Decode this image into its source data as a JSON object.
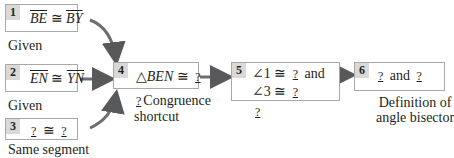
{
  "flowchart": {
    "boxes": [
      {
        "num": "1",
        "left": "BE",
        "cong": "≅",
        "right": "BY",
        "reason": "Given"
      },
      {
        "num": "2",
        "left": "EN",
        "cong": "≅",
        "right": "YN",
        "reason": "Given"
      },
      {
        "num": "3",
        "left": "?",
        "cong": "≅",
        "right": "?",
        "reason": "Same segment"
      },
      {
        "num": "4",
        "tri": "△",
        "name": "BEN",
        "cong": "≅",
        "blank": "?",
        "reason_blank": "?",
        "reason_line1": "Congruence",
        "reason_line2": "shortcut"
      },
      {
        "num": "5",
        "ang1": "∠1",
        "cong1": "≅",
        "blank1": "?",
        "and": "and",
        "ang2": "∠3",
        "cong2": "≅",
        "blank2": "?",
        "reason_blank": "?"
      },
      {
        "num": "6",
        "blank1": "?",
        "and": "and",
        "blank2": "?",
        "reason_line1": "Definition of",
        "reason_line2": "angle bisector"
      }
    ]
  },
  "colors": {
    "arrow": "#6d6e71",
    "box_border": "#a8a8a8",
    "num_bg": "#d9d9d9"
  }
}
